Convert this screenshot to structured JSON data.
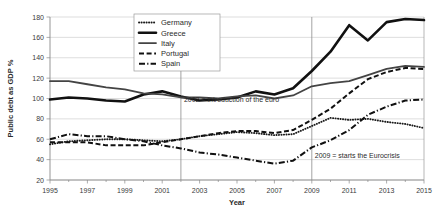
{
  "chart_data": {
    "type": "line",
    "title": "",
    "xlabel": "Year",
    "ylabel": "Public debt as GDP %",
    "xlim": [
      1995,
      2015
    ],
    "ylim": [
      20,
      180
    ],
    "ytick_step": 20,
    "xtick_step": 2,
    "grid": true,
    "legend_position": "top-center",
    "yticks": [
      "20",
      "40",
      "60",
      "80",
      "100",
      "120",
      "140",
      "160",
      "180"
    ],
    "xticks": [
      "1995",
      "1997",
      "1999",
      "2001",
      "2003",
      "2005",
      "2007",
      "2009",
      "2011",
      "2013",
      "2015"
    ],
    "x": [
      1995,
      1996,
      1997,
      1998,
      1999,
      2000,
      2001,
      2002,
      2003,
      2004,
      2005,
      2006,
      2007,
      2008,
      2009,
      2010,
      2011,
      2012,
      2013,
      2014,
      2015
    ],
    "series": [
      {
        "name": "Germany",
        "style": "dotted",
        "color": "#1a1a1a",
        "values": [
          55,
          58,
          59,
          60,
          60,
          59,
          58,
          60,
          63,
          65,
          67,
          66,
          64,
          65,
          73,
          81,
          79,
          80,
          77,
          75,
          71
        ]
      },
      {
        "name": "Greece",
        "style": "thick-solid",
        "color": "#111111",
        "values": [
          99,
          101,
          100,
          98,
          97,
          104,
          107,
          102,
          98,
          99,
          101,
          107,
          104,
          110,
          127,
          146,
          172,
          157,
          175,
          178,
          177
        ]
      },
      {
        "name": "Italy",
        "style": "solid",
        "color": "#444444",
        "values": [
          117,
          117,
          114,
          111,
          109,
          105,
          104,
          101,
          101,
          100,
          102,
          103,
          100,
          103,
          112,
          115,
          117,
          123,
          129,
          132,
          131
        ]
      },
      {
        "name": "Portugal",
        "style": "dashed",
        "color": "#111111",
        "values": [
          57,
          57,
          57,
          54,
          54,
          54,
          57,
          60,
          63,
          66,
          68,
          68,
          66,
          69,
          79,
          90,
          105,
          119,
          126,
          130,
          129
        ]
      },
      {
        "name": "Spain",
        "style": "dash-dot",
        "color": "#111111",
        "values": [
          60,
          65,
          63,
          63,
          60,
          58,
          54,
          51,
          47,
          45,
          42,
          39,
          36,
          39,
          52,
          59,
          69,
          84,
          92,
          98,
          99
        ]
      }
    ],
    "annotations": [
      {
        "text": "2002 = introduction of the euro",
        "year": 2002,
        "value": 97
      },
      {
        "text": "2009 = starts the Eurocrisis",
        "year": 2009,
        "value": 42
      }
    ],
    "reference_lines": [
      {
        "year": 2002
      },
      {
        "year": 2009
      }
    ]
  }
}
